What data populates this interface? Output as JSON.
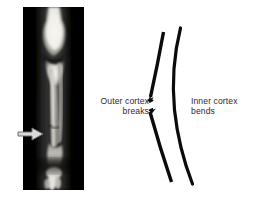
{
  "figure": {
    "kind": "medical-illustration",
    "background": "#ffffff",
    "width": 262,
    "height": 202
  },
  "xray": {
    "name": "forearm-radiograph",
    "background": "#000000",
    "bone_bright": "#f2f2ee",
    "bone_mid": "#b9b7b0",
    "soft_tissue": "#3a3a38",
    "marker": {
      "icon": "arrow-right-icon",
      "fill": "#d8d8d8",
      "outline": "#6a6a6a"
    }
  },
  "diagram": {
    "name": "greenstick-fracture-schematic",
    "stroke": "#0b0b0b",
    "outer_cortex": {
      "label_line1": "Outer cortex",
      "label_line2": "breaks"
    },
    "inner_cortex": {
      "label_line1": "Inner cortex",
      "label_line2": "bends"
    }
  },
  "labels": {
    "outer": [
      "Outer cortex",
      "breaks"
    ],
    "inner": [
      "Inner cortex",
      "bends"
    ]
  }
}
